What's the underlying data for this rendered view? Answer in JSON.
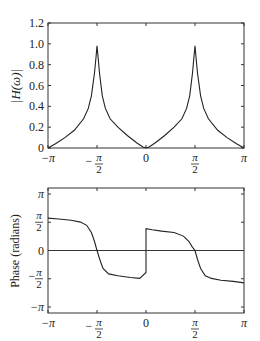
{
  "chart_data": [
    {
      "type": "line",
      "title": "",
      "xlabel": "",
      "ylabel": "|H(ω)|",
      "xlim": [
        -3.14159,
        3.14159
      ],
      "ylim": [
        0,
        1.2
      ],
      "xticks": [
        "−π",
        "−π/2",
        "0",
        "π/2",
        "π"
      ],
      "yticks": [
        "0",
        "0.2",
        "0.4",
        "0.6",
        "0.8",
        "1.0",
        "1.2"
      ],
      "grid": false,
      "series": [
        {
          "name": "magnitude",
          "x": [
            -3.1416,
            -2.9,
            -2.6,
            -2.3,
            -2.0,
            -1.85,
            -1.75,
            -1.65,
            -1.6,
            -1.5708,
            -1.54,
            -1.49,
            -1.4,
            -1.3,
            -1.15,
            -0.9,
            -0.6,
            -0.3,
            -0.1,
            0.0,
            0.1,
            0.3,
            0.6,
            0.9,
            1.15,
            1.3,
            1.4,
            1.49,
            1.54,
            1.5708,
            1.6,
            1.65,
            1.75,
            1.85,
            2.0,
            2.3,
            2.6,
            2.9,
            3.1416
          ],
          "y": [
            0.0,
            0.04,
            0.1,
            0.17,
            0.28,
            0.38,
            0.5,
            0.72,
            0.88,
            0.98,
            0.88,
            0.72,
            0.5,
            0.38,
            0.28,
            0.2,
            0.12,
            0.05,
            0.01,
            0.0,
            0.01,
            0.05,
            0.12,
            0.2,
            0.28,
            0.38,
            0.5,
            0.72,
            0.88,
            0.98,
            0.88,
            0.72,
            0.5,
            0.38,
            0.28,
            0.17,
            0.1,
            0.04,
            0.0
          ]
        }
      ]
    },
    {
      "type": "line",
      "title": "",
      "xlabel": "",
      "ylabel": "Phase (radians)",
      "xlim": [
        -3.14159,
        3.14159
      ],
      "ylim": [
        -3.14159,
        3.14159
      ],
      "xticks": [
        "−π",
        "−π/2",
        "0",
        "π/2",
        "π"
      ],
      "yticks": [
        "−π",
        "−π/2",
        "0",
        "π/2",
        "π"
      ],
      "grid": false,
      "zero_line": true,
      "series": [
        {
          "name": "phase",
          "x": [
            -3.1416,
            -2.8,
            -2.4,
            -2.1,
            -1.9,
            -1.75,
            -1.65,
            -1.5708,
            -1.48,
            -1.38,
            -1.2,
            -0.9,
            -0.5,
            -0.2,
            -0.001,
            0.001,
            0.2,
            0.5,
            0.9,
            1.2,
            1.38,
            1.48,
            1.5708,
            1.65,
            1.75,
            1.9,
            2.1,
            2.4,
            2.8,
            3.1416
          ],
          "y": [
            1.8,
            1.75,
            1.68,
            1.58,
            1.4,
            1.0,
            0.5,
            0.0,
            -0.5,
            -1.0,
            -1.3,
            -1.4,
            -1.5,
            -1.55,
            -1.22,
            1.22,
            1.15,
            1.08,
            1.0,
            0.8,
            0.5,
            0.2,
            0.0,
            -0.5,
            -1.0,
            -1.4,
            -1.55,
            -1.65,
            -1.72,
            -1.8
          ]
        }
      ]
    }
  ],
  "plots": {
    "top": {
      "ylabel": "|H(ω)|",
      "xticks": [
        "−π",
        "−π/2",
        "0",
        "π/2",
        "π"
      ],
      "yticks": [
        "0",
        "0.2",
        "0.4",
        "0.6",
        "0.8",
        "1.0",
        "1.2"
      ]
    },
    "bottom": {
      "ylabel": "Phase (radians)",
      "xticks": [
        "−π",
        "−π/2",
        "0",
        "π/2",
        "π"
      ],
      "yticks": [
        "−π",
        "−π/2",
        "0",
        "π/2",
        "π"
      ]
    }
  },
  "colors": {
    "line": "#222222",
    "axis": "#333333",
    "background": "#ffffff"
  }
}
